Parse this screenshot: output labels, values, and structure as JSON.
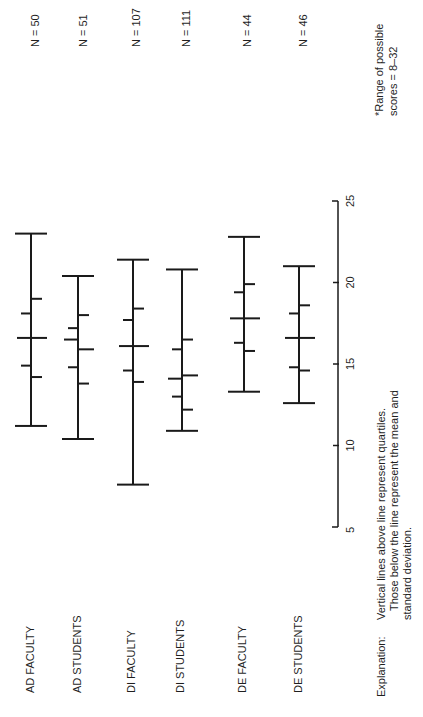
{
  "chart_data": {
    "type": "box-summary",
    "title": "",
    "orientation": "rotated-90-ccw",
    "xlabel": "",
    "ylabel": "",
    "axis": {
      "ticks": [
        5,
        10,
        15,
        20,
        25
      ],
      "range": [
        5,
        25
      ]
    },
    "note": "*Range of possible scores = 8–32",
    "explanation_label": "Explanation:",
    "explanation_lines": [
      "Vertical lines above line represent quartiles.",
      "Those below the line represent the mean and",
      "standard deviation."
    ],
    "categories": [
      "AD FACULTY",
      "AD STUDENTS",
      "DI FACULTY",
      "DI STUDENTS",
      "DE FACULTY",
      "DE STUDENTS"
    ],
    "n_labels": [
      "N = 50",
      "N = 51",
      "N = 107",
      "N = 111",
      "N = 44",
      "N = 46"
    ],
    "series": [
      {
        "name": "AD FACULTY",
        "n": 50,
        "min": 11.2,
        "max": 23.0,
        "q1": 14.9,
        "median": 16.6,
        "q3": 18.1,
        "mean": 16.6,
        "sd_low": 14.2,
        "sd_high": 19.0
      },
      {
        "name": "AD STUDENTS",
        "n": 51,
        "min": 10.4,
        "max": 20.4,
        "q1": 14.8,
        "median": 16.5,
        "q3": 17.2,
        "mean": 15.9,
        "sd_low": 13.8,
        "sd_high": 18.0
      },
      {
        "name": "DI FACULTY",
        "n": 107,
        "min": 7.6,
        "max": 21.4,
        "q1": 14.6,
        "median": 16.1,
        "q3": 17.7,
        "mean": 16.1,
        "sd_low": 13.9,
        "sd_high": 18.4
      },
      {
        "name": "DI STUDENTS",
        "n": 111,
        "min": 10.9,
        "max": 20.8,
        "q1": 13.0,
        "median": 14.1,
        "q3": 15.9,
        "mean": 14.3,
        "sd_low": 12.2,
        "sd_high": 16.5
      },
      {
        "name": "DE FACULTY",
        "n": 44,
        "min": 13.3,
        "max": 22.8,
        "q1": 16.3,
        "median": 17.8,
        "q3": 19.4,
        "mean": 17.8,
        "sd_low": 15.8,
        "sd_high": 19.9
      },
      {
        "name": "DE STUDENTS",
        "n": 46,
        "min": 12.6,
        "max": 21.0,
        "q1": 14.8,
        "median": 16.6,
        "q3": 18.1,
        "mean": 16.6,
        "sd_low": 14.6,
        "sd_high": 18.6
      }
    ]
  }
}
